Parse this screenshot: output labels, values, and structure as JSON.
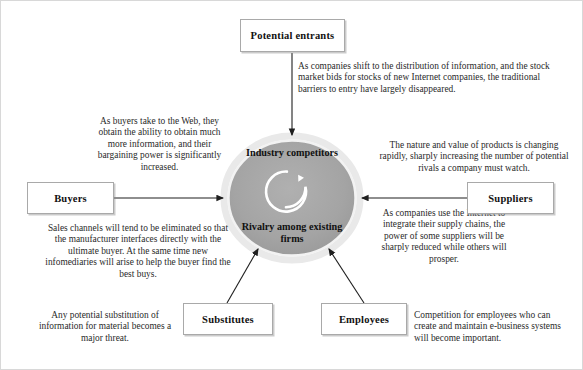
{
  "diagram": {
    "center": {
      "top_label": "Industry competitors",
      "bottom_label": "Rivalry among existing firms",
      "icon": "circular-arrow-icon",
      "fill_color": "#a3a3a3",
      "ring_color": "#ffffff"
    },
    "boxes": [
      {
        "id": "potential-entrants",
        "label": "Potential entrants"
      },
      {
        "id": "buyers",
        "label": "Buyers"
      },
      {
        "id": "suppliers",
        "label": "Suppliers"
      },
      {
        "id": "substitutes",
        "label": "Substitutes"
      },
      {
        "id": "employees",
        "label": "Employees"
      }
    ],
    "notes": [
      {
        "id": "note-potential-entrants",
        "align": "left",
        "text": "As companies shift to the distribution of information, and the stock market bids for stocks of new Internet companies, the traditional barriers to entry have largely disappeared."
      },
      {
        "id": "note-buyers-power",
        "align": "center",
        "text": "As buyers take to the Web, they obtain the ability to obtain much more information, and their bargaining power is significantly increased."
      },
      {
        "id": "note-buyers-channels",
        "align": "center",
        "text": "Sales channels will tend to be eliminated so that the manufacturer interfaces directly with the ultimate buyer.  At the same time new infomediaries will arise to help the buyer find the best buys."
      },
      {
        "id": "note-substitutes",
        "align": "center",
        "text": "The nature and value of products is changing rapidly, sharply increasing the number of potential rivals a company must watch."
      },
      {
        "id": "note-suppliers",
        "align": "center",
        "text": "As companies use the Internet to integrate their supply chains, the power of some suppliers will be sharply reduced while others will prosper."
      },
      {
        "id": "note-substitution",
        "align": "center",
        "text": "Any potential substitution of information for material becomes a major threat."
      },
      {
        "id": "note-employees",
        "align": "left",
        "text": "Competition for employees who can create and maintain e-business systems will become important."
      }
    ]
  }
}
